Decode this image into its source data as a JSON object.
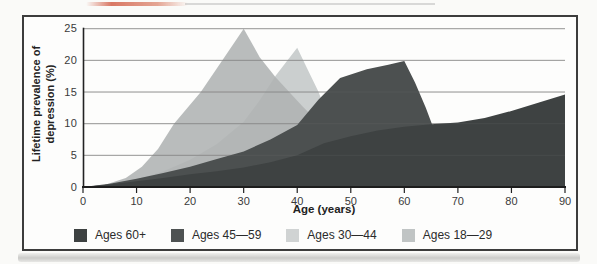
{
  "chart_data": {
    "type": "area",
    "title": "",
    "xlabel": "Age (years)",
    "ylabel": "Lifetime prevalence of depression (%)",
    "ylabel_lines": [
      "Lifetime prevalence of",
      "depression (%)"
    ],
    "xlim": [
      0,
      90
    ],
    "ylim": [
      0,
      25
    ],
    "x_ticks": [
      0,
      10,
      20,
      30,
      40,
      50,
      60,
      70,
      80,
      90
    ],
    "y_ticks": [
      0,
      5,
      10,
      15,
      20,
      25
    ],
    "grid": "horizontal",
    "legend_position": "bottom",
    "series": [
      {
        "name": "Ages 30—44",
        "layer": "back",
        "color": "#cbcfcf",
        "opacity": 1,
        "points": [
          [
            0,
            0
          ],
          [
            5,
            0.4
          ],
          [
            10,
            1.2
          ],
          [
            15,
            2.5
          ],
          [
            20,
            4.3
          ],
          [
            25,
            6.8
          ],
          [
            30,
            10.3
          ],
          [
            33,
            13.7
          ],
          [
            36,
            17.6
          ],
          [
            40,
            22
          ],
          [
            42,
            18.5
          ],
          [
            44,
            15
          ],
          [
            47,
            8
          ],
          [
            49,
            3
          ],
          [
            51,
            0
          ]
        ]
      },
      {
        "name": "Ages 18—29",
        "layer": "back",
        "color": "#afb3b3",
        "opacity": 0.88,
        "points": [
          [
            0,
            0
          ],
          [
            4,
            0.3
          ],
          [
            8,
            1.4
          ],
          [
            11,
            3.2
          ],
          [
            14,
            6
          ],
          [
            17,
            10
          ],
          [
            22,
            15
          ],
          [
            26,
            20
          ],
          [
            30,
            25
          ],
          [
            33,
            20.5
          ],
          [
            36,
            17.3
          ],
          [
            41,
            12.7
          ],
          [
            46,
            8.5
          ],
          [
            52,
            3.5
          ],
          [
            56,
            0
          ]
        ]
      },
      {
        "name": "Ages 45—59",
        "layer": "front",
        "color": "#4c5050",
        "opacity": 1,
        "points": [
          [
            0,
            0
          ],
          [
            5,
            0.5
          ],
          [
            10,
            1.3
          ],
          [
            15,
            2.2
          ],
          [
            20,
            3.2
          ],
          [
            25,
            4.4
          ],
          [
            30,
            5.6
          ],
          [
            35,
            7.5
          ],
          [
            40,
            9.8
          ],
          [
            44,
            13.8
          ],
          [
            48,
            17.2
          ],
          [
            53,
            18.6
          ],
          [
            57,
            19.3
          ],
          [
            60,
            19.9
          ],
          [
            62,
            16.5
          ],
          [
            64,
            12.5
          ],
          [
            66,
            8
          ],
          [
            68,
            3.5
          ],
          [
            69.5,
            0
          ]
        ]
      },
      {
        "name": "Ages 60+",
        "layer": "front",
        "color": "#3e4242",
        "opacity": 1,
        "points": [
          [
            0,
            0
          ],
          [
            5,
            0.4
          ],
          [
            10,
            0.9
          ],
          [
            15,
            1.4
          ],
          [
            20,
            2
          ],
          [
            25,
            2.5
          ],
          [
            30,
            3.1
          ],
          [
            35,
            3.9
          ],
          [
            40,
            5
          ],
          [
            45,
            6.9
          ],
          [
            50,
            8
          ],
          [
            55,
            8.9
          ],
          [
            60,
            9.5
          ],
          [
            65,
            9.9
          ],
          [
            70,
            10.2
          ],
          [
            75,
            10.9
          ],
          [
            80,
            12
          ],
          [
            85,
            13.3
          ],
          [
            90,
            14.6
          ]
        ]
      }
    ],
    "legend": [
      {
        "label": "Ages 60+",
        "color": "#3d4141"
      },
      {
        "label": "Ages 45—59",
        "color": "#4e5252"
      },
      {
        "label": "Ages 30—44",
        "color": "#d0d3d3"
      },
      {
        "label": "Ages 18—29",
        "color": "#c0c4c4"
      }
    ]
  }
}
